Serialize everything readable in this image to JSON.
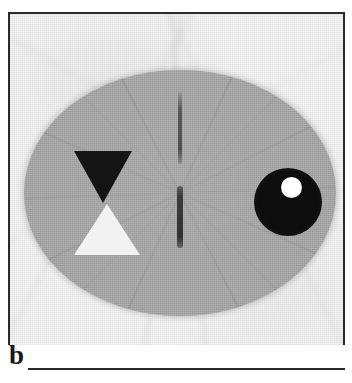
{
  "figure": {
    "panel_label": "b",
    "modality": "tomographic-reconstruction",
    "background_color": "#f4f4f4",
    "frame_color": "#2b2b2b"
  },
  "phantom": {
    "body": {
      "name": "background-ellipse",
      "shape": "ellipse",
      "fill_color": "#a9a9a9"
    },
    "objects": [
      {
        "name": "dark-triangle",
        "shape": "triangle-down",
        "fill_color": "#151515",
        "position": "left-upper"
      },
      {
        "name": "light-triangle",
        "shape": "triangle-up",
        "fill_color": "#f2f2f2",
        "position": "left-lower"
      },
      {
        "name": "dark-disc",
        "shape": "circle",
        "fill_color": "#0d0d0d",
        "position": "right-center"
      },
      {
        "name": "bright-inclusion",
        "shape": "circle",
        "fill_color": "#ffffff",
        "position": "inside-dark-disc-upper-left"
      },
      {
        "name": "center-rod-upper",
        "shape": "bar-vertical",
        "fill_color": "#3c3c3c",
        "position": "center-upper"
      },
      {
        "name": "center-rod-lower",
        "shape": "bar-vertical",
        "fill_color": "#333333",
        "position": "center-lower"
      }
    ]
  }
}
